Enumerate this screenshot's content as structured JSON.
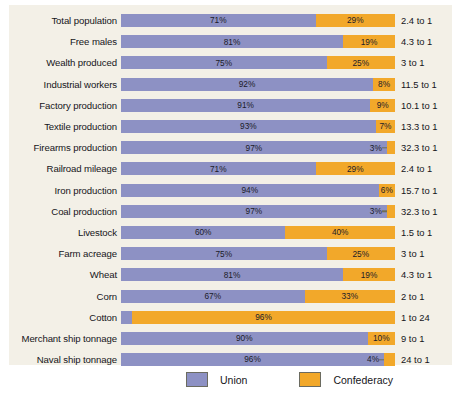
{
  "chart_data": {
    "type": "bar",
    "subtype": "stacked-horizontal-100pct",
    "title": "",
    "xlabel": "",
    "ylabel": "",
    "xlim": [
      0,
      100
    ],
    "grid": false,
    "legend_position": "bottom",
    "categories": [
      "Total population",
      "Free males",
      "Wealth produced",
      "Industrial workers",
      "Factory production",
      "Textile production",
      "Firearms production",
      "Railroad mileage",
      "Iron production",
      "Coal production",
      "Livestock",
      "Farm acreage",
      "Wheat",
      "Corn",
      "Cotton",
      "Merchant ship tonnage",
      "Naval ship tonnage"
    ],
    "series": [
      {
        "name": "Union",
        "color": "#8d91c4",
        "values": [
          71,
          81,
          75,
          92,
          91,
          93,
          97,
          71,
          94,
          97,
          60,
          75,
          81,
          67,
          4,
          90,
          96
        ]
      },
      {
        "name": "Confederacy",
        "color": "#f2a82a",
        "values": [
          29,
          19,
          25,
          8,
          9,
          7,
          3,
          29,
          6,
          3,
          40,
          25,
          19,
          33,
          96,
          10,
          4
        ]
      }
    ],
    "annotations_ratio": [
      "2.4 to 1",
      "4.3 to 1",
      "3 to 1",
      "11.5 to 1",
      "10.1 to 1",
      "13.3 to 1",
      "32.3 to 1",
      "2.4 to 1",
      "15.7 to 1",
      "32.3 to 1",
      "1.5 to 1",
      "3 to 1",
      "4.3 to 1",
      "2 to 1",
      "1 to 24",
      "9 to 1",
      "24 to 1"
    ]
  },
  "rows": [
    {
      "label": "Total population",
      "union_pct": 71,
      "conf_pct": 29,
      "union_label": "71%",
      "conf_label": "29%",
      "ratio": "2.4 to 1",
      "union_label_pos": "inside",
      "conf_label_pos": "inside"
    },
    {
      "label": "Free males",
      "union_pct": 81,
      "conf_pct": 19,
      "union_label": "81%",
      "conf_label": "19%",
      "ratio": "4.3 to 1",
      "union_label_pos": "inside",
      "conf_label_pos": "inside"
    },
    {
      "label": "Wealth produced",
      "union_pct": 75,
      "conf_pct": 25,
      "union_label": "75%",
      "conf_label": "25%",
      "ratio": "3 to 1",
      "union_label_pos": "inside",
      "conf_label_pos": "inside"
    },
    {
      "label": "Industrial workers",
      "union_pct": 92,
      "conf_pct": 8,
      "union_label": "92%",
      "conf_label": "8%",
      "ratio": "11.5 to 1",
      "union_label_pos": "inside",
      "conf_label_pos": "inside"
    },
    {
      "label": "Factory production",
      "union_pct": 91,
      "conf_pct": 9,
      "union_label": "91%",
      "conf_label": "9%",
      "ratio": "10.1 to 1",
      "union_label_pos": "inside",
      "conf_label_pos": "inside"
    },
    {
      "label": "Textile production",
      "union_pct": 93,
      "conf_pct": 7,
      "union_label": "93%",
      "conf_label": "7%",
      "ratio": "13.3 to 1",
      "union_label_pos": "inside",
      "conf_label_pos": "inside"
    },
    {
      "label": "Firearms production",
      "union_pct": 97,
      "conf_pct": 3,
      "union_label": "97%",
      "conf_label": "3%",
      "ratio": "32.3 to 1",
      "union_label_pos": "inside",
      "conf_label_pos": "outside-left"
    },
    {
      "label": "Railroad mileage",
      "union_pct": 71,
      "conf_pct": 29,
      "union_label": "71%",
      "conf_label": "29%",
      "ratio": "2.4 to 1",
      "union_label_pos": "inside",
      "conf_label_pos": "inside"
    },
    {
      "label": "Iron production",
      "union_pct": 94,
      "conf_pct": 6,
      "union_label": "94%",
      "conf_label": "6%",
      "ratio": "15.7 to 1",
      "union_label_pos": "inside",
      "conf_label_pos": "inside"
    },
    {
      "label": "Coal production",
      "union_pct": 97,
      "conf_pct": 3,
      "union_label": "97%",
      "conf_label": "3%",
      "ratio": "32.3 to 1",
      "union_label_pos": "inside",
      "conf_label_pos": "outside-left"
    },
    {
      "label": "Livestock",
      "union_pct": 60,
      "conf_pct": 40,
      "union_label": "60%",
      "conf_label": "40%",
      "ratio": "1.5 to 1",
      "union_label_pos": "inside",
      "conf_label_pos": "inside"
    },
    {
      "label": "Farm acreage",
      "union_pct": 75,
      "conf_pct": 25,
      "union_label": "75%",
      "conf_label": "25%",
      "ratio": "3 to 1",
      "union_label_pos": "inside",
      "conf_label_pos": "inside"
    },
    {
      "label": "Wheat",
      "union_pct": 81,
      "conf_pct": 19,
      "union_label": "81%",
      "conf_label": "19%",
      "ratio": "4.3 to 1",
      "union_label_pos": "inside",
      "conf_label_pos": "inside"
    },
    {
      "label": "Corn",
      "union_pct": 67,
      "conf_pct": 33,
      "union_label": "67%",
      "conf_label": "33%",
      "ratio": "2 to 1",
      "union_label_pos": "inside",
      "conf_label_pos": "inside"
    },
    {
      "label": "Cotton",
      "union_pct": 4,
      "conf_pct": 96,
      "union_label": "4%",
      "conf_label": "96%",
      "ratio": "1 to 24",
      "union_label_pos": "outside-right",
      "conf_label_pos": "inside"
    },
    {
      "label": "Merchant ship tonnage",
      "union_pct": 90,
      "conf_pct": 10,
      "union_label": "90%",
      "conf_label": "10%",
      "ratio": "9 to 1",
      "union_label_pos": "inside",
      "conf_label_pos": "inside"
    },
    {
      "label": "Naval ship tonnage",
      "union_pct": 96,
      "conf_pct": 4,
      "union_label": "96%",
      "conf_label": "4%",
      "ratio": "24 to 1",
      "union_label_pos": "inside",
      "conf_label_pos": "outside-left"
    }
  ],
  "legend": {
    "union_label": "Union",
    "confederacy_label": "Confederacy",
    "union_color": "#8d91c4",
    "confederacy_color": "#f2a82a"
  },
  "colors": {
    "panel_background": "#f3f0e7",
    "page_background": "#ffffff",
    "text": "#15151a"
  }
}
